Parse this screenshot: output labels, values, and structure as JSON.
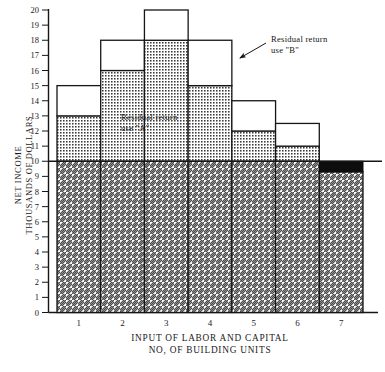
{
  "chart_data": {
    "type": "bar",
    "title": "",
    "xlabel": "INPUT OF LABOR AND CAPITAL",
    "xlabel2": "NO, OF BUILDING UNITS",
    "ylabel": "NET INCOME",
    "ylabel2": "THOUSANDS OF DOLLARS",
    "categories": [
      "1",
      "2",
      "3",
      "4",
      "5",
      "6",
      "7"
    ],
    "ylim": [
      0,
      20
    ],
    "xlim": [
      0,
      7
    ],
    "ytick_labels": [
      "0",
      "1",
      "2",
      "3",
      "4",
      "5",
      "6",
      "7",
      "8",
      "9",
      "10",
      "11",
      "12",
      "13",
      "14",
      "15",
      "16",
      "17",
      "18",
      "19",
      "20"
    ],
    "grid": false,
    "legend": "none",
    "reference_line": 10,
    "series": [
      {
        "name": "Return to land (hatched base)",
        "values": [
          10,
          10,
          10,
          10,
          10,
          10,
          9.3
        ],
        "pattern": "diagonal-hatch"
      },
      {
        "name": "Residual return use \"A\" (dotted top)",
        "values": [
          13,
          16,
          18,
          15,
          12,
          11,
          9.3
        ],
        "pattern": "dotted"
      },
      {
        "name": "Residual return use \"B\" (outline top)",
        "values": [
          15,
          18,
          20,
          18,
          14,
          12.5,
          9.3
        ],
        "pattern": "outline"
      },
      {
        "name": "Negative / loss (solid black)",
        "values": [
          0,
          0,
          0,
          0,
          0,
          0,
          0.7
        ],
        "pattern": "solid-black"
      }
    ],
    "annotations": [
      {
        "name": "annotation-a",
        "line1": "Residual return",
        "line2": "use \"A\"",
        "x": 3.0,
        "y": 13.2
      },
      {
        "name": "annotation-b",
        "line1": "Residual return",
        "line2": "use \"B\"",
        "x": 6.0,
        "y": 19.0,
        "arrow_to": {
          "x": 4.62,
          "y": 17.6
        }
      }
    ]
  },
  "axes": {
    "y_title_line1": "NET INCOME",
    "y_title_line2": "THOUSANDS OF DOLLARS",
    "x_title_line1": "INPUT OF LABOR AND CAPITAL",
    "x_title_line2": "NO, OF BUILDING UNITS"
  },
  "colors": {
    "ink": "#161616",
    "background": "#ffffff",
    "solid_black": "#0d0d0d",
    "hatch": "#4a4a4a",
    "dot": "#3d3d3d"
  }
}
